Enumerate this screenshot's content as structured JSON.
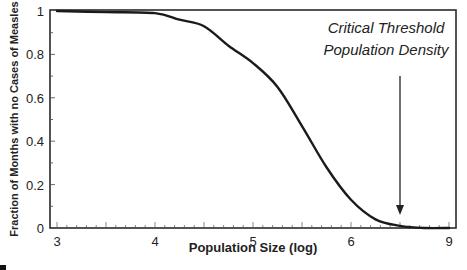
{
  "chart_data": {
    "type": "line",
    "title": "",
    "xlabel": "Population Size (log)",
    "ylabel": "Fraction of Months with no Cases of Measles",
    "xlim": [
      3,
      7
    ],
    "ylim": [
      0,
      1
    ],
    "x_ticks": [
      {
        "value": 3,
        "label": "3"
      },
      {
        "value": 4,
        "label": "4"
      },
      {
        "value": 5,
        "label": "5"
      },
      {
        "value": 6,
        "label": "6"
      },
      {
        "value": 7,
        "label": "9"
      }
    ],
    "y_ticks": [
      {
        "value": 0,
        "label": "0"
      },
      {
        "value": 0.2,
        "label": "0.2"
      },
      {
        "value": 0.4,
        "label": "0.4"
      },
      {
        "value": 0.6,
        "label": "0.6"
      },
      {
        "value": 0.8,
        "label": "0.8"
      },
      {
        "value": 1,
        "label": "1"
      }
    ],
    "grid": false,
    "legend": null,
    "series": [
      {
        "name": "Fraction of months with no measles",
        "x": [
          3.0,
          3.5,
          4.0,
          4.25,
          4.5,
          4.75,
          5.0,
          5.25,
          5.5,
          5.75,
          6.0,
          6.25,
          6.5,
          6.75,
          7.0
        ],
        "values": [
          1.0,
          0.995,
          0.99,
          0.96,
          0.93,
          0.84,
          0.76,
          0.65,
          0.47,
          0.28,
          0.13,
          0.04,
          0.01,
          0.0,
          0.0
        ]
      }
    ],
    "annotations": [
      {
        "text_line1": "Critical Threshold",
        "text_line2": "Population Density",
        "arrow_x": 6.5,
        "arrow_from_y": 0.7,
        "arrow_to_y": 0.06
      }
    ]
  },
  "colors": {
    "line": "#1a1a1a",
    "axis": "#2a2a2a",
    "background": "#ffffff"
  }
}
